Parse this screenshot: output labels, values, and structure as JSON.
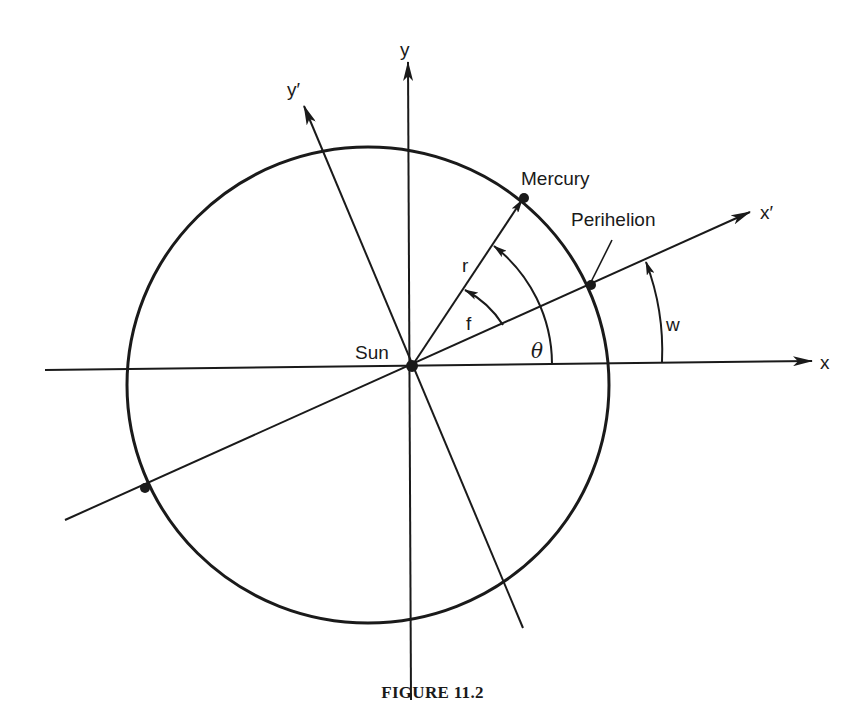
{
  "figure": {
    "caption": "FIGURE 11.2"
  },
  "axes": {
    "x_label": "x",
    "y_label": "y",
    "x_prime_label": "x′",
    "y_prime_label": "y′"
  },
  "bodies": {
    "sun_label": "Sun",
    "mercury_label": "Mercury",
    "perihelion_label": "Perihelion"
  },
  "quantities": {
    "radius_label": "r",
    "true_anomaly_label": "f",
    "theta_label": "θ",
    "perihelion_arg_label": "w"
  },
  "colors": {
    "ink": "#1a1a1a",
    "background": "#ffffff"
  }
}
